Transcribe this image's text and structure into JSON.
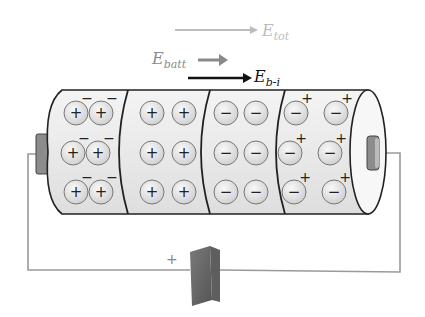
{
  "labels": {
    "e_tot": {
      "main": "E",
      "sub": "tot"
    },
    "e_batt": {
      "main": "E",
      "sub": "batt"
    },
    "e_bi": {
      "main": "E",
      "sub": "b-i"
    },
    "terminal_sign": "+"
  },
  "colors": {
    "e_tot": "#bdbdbd",
    "e_batt": "#8a8a8a",
    "e_bi": "#111111",
    "wire": "#9a9a9a",
    "terminal": "#8c8c8c",
    "particle_fill": "#e4e4e4",
    "cell_fill": "#eeeeee"
  },
  "sections": [
    {
      "name": "section-1",
      "particle": "+",
      "extra_charge": "−"
    },
    {
      "name": "section-2",
      "particle": "+",
      "extra_charge": ""
    },
    {
      "name": "section-3",
      "particle": "−",
      "extra_charge": ""
    },
    {
      "name": "section-4",
      "particle": "−",
      "extra_charge": "+"
    }
  ]
}
